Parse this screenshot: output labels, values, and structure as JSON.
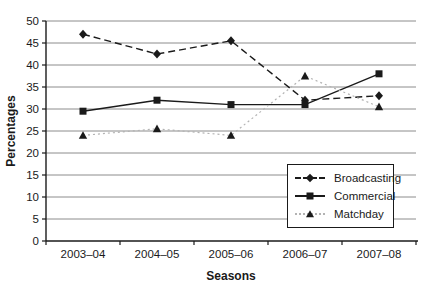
{
  "chart_data": {
    "type": "line",
    "title": "",
    "xlabel": "Seasons",
    "ylabel": "Percentages",
    "categories": [
      "2003–04",
      "2004–05",
      "2005–06",
      "2006–07",
      "2007–08"
    ],
    "series": [
      {
        "name": "Broadcasting",
        "values": [
          47,
          42.5,
          45.5,
          32,
          33
        ],
        "line_style": "dashed",
        "marker": "diamond",
        "color": "#1a1a1a",
        "marker_color": "#1a1a1a"
      },
      {
        "name": "Commercial",
        "values": [
          29.5,
          32,
          31,
          31,
          38
        ],
        "line_style": "solid",
        "marker": "square",
        "color": "#1a1a1a",
        "marker_color": "#1a1a1a"
      },
      {
        "name": "Matchday",
        "values": [
          24,
          25.5,
          24,
          37.5,
          30.5
        ],
        "line_style": "dotted",
        "marker": "triangle",
        "color": "#b3b3b3",
        "marker_color": "#1a1a1a"
      }
    ],
    "ylim": [
      0,
      50
    ],
    "y_ticks": [
      0,
      5,
      10,
      15,
      20,
      25,
      30,
      35,
      40,
      45,
      50
    ],
    "grid": true,
    "legend_position": "inside-right",
    "gridline_color": "#8c8c8c",
    "axis_color": "#1a1a1a",
    "text_color": "#1a1a1a"
  }
}
